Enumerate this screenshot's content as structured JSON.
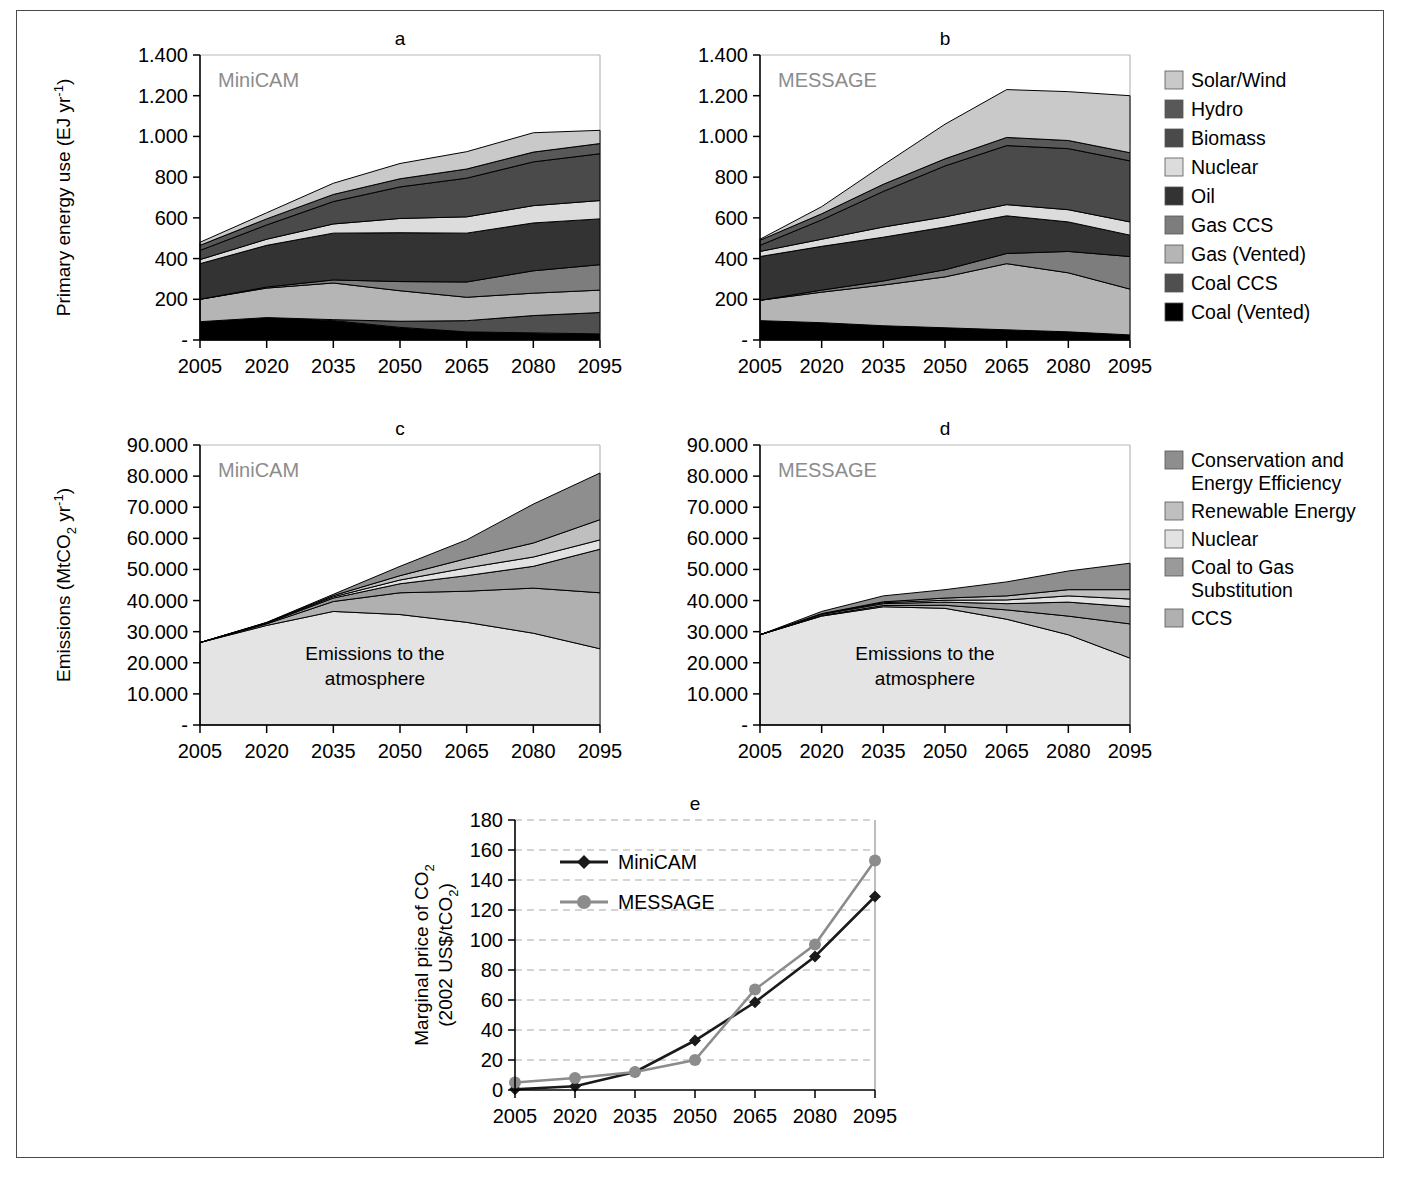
{
  "figure": {
    "panels": [
      "a",
      "b",
      "c",
      "d",
      "e"
    ],
    "model_minicam": "MiniCAM",
    "model_message": "MESSAGE",
    "atmosphere_label_line1": "Emissions to the",
    "atmosphere_label_line2": "atmosphere"
  },
  "energy_legend": {
    "items": [
      {
        "label": "Solar/Wind",
        "color": "#c9c9c9"
      },
      {
        "label": "Hydro",
        "color": "#585858"
      },
      {
        "label": "Biomass",
        "color": "#4a4a4a"
      },
      {
        "label": "Nuclear",
        "color": "#dcdcdc"
      },
      {
        "label": "Oil",
        "color": "#333333"
      },
      {
        "label": "Gas CCS",
        "color": "#7d7d7d"
      },
      {
        "label": "Gas (Vented)",
        "color": "#b5b5b5"
      },
      {
        "label": "Coal CCS",
        "color": "#4f4f4f"
      },
      {
        "label": "Coal (Vented)",
        "color": "#000000"
      }
    ]
  },
  "wedge_legend": {
    "items": [
      {
        "label": "Conservation and Energy Efficiency",
        "color": "#8e8e8e"
      },
      {
        "label": "Renewable Energy",
        "color": "#bfbfbf"
      },
      {
        "label": "Nuclear",
        "color": "#e2e2e2"
      },
      {
        "label": "Coal to Gas Substitution",
        "color": "#9a9a9a"
      },
      {
        "label": "CCS",
        "color": "#b0b0b0"
      }
    ]
  },
  "chart_data": [
    {
      "id": "a",
      "type": "area",
      "title": "a",
      "annotation": "MiniCAM",
      "xlabel": "",
      "ylabel": "Primary energy use (EJ yr-1)",
      "ylabel_display": "Primary energy use (EJ yr",
      "categories": [
        2005,
        2020,
        2035,
        2050,
        2065,
        2080,
        2095
      ],
      "xticklabels": [
        "2005",
        "2020",
        "2035",
        "2050",
        "2065",
        "2080",
        "2095"
      ],
      "yticklabels": [
        "-",
        "200",
        "400",
        "600",
        "800",
        "1.000",
        "1.200",
        "1.400"
      ],
      "ylim": [
        0,
        1400
      ],
      "ytickvalues": [
        0,
        200,
        400,
        600,
        800,
        1000,
        1200,
        1400
      ],
      "grid": false,
      "stack_order_bottom_to_top": [
        "Coal (Vented)",
        "Coal CCS",
        "Gas (Vented)",
        "Gas CCS",
        "Oil",
        "Nuclear",
        "Biomass",
        "Hydro",
        "Solar/Wind"
      ],
      "series": [
        {
          "name": "Coal (Vented)",
          "color": "#000000",
          "values": [
            90,
            110,
            95,
            62,
            40,
            35,
            30
          ]
        },
        {
          "name": "Coal CCS",
          "color": "#4f4f4f",
          "values": [
            0,
            0,
            5,
            30,
            55,
            85,
            105
          ]
        },
        {
          "name": "Gas (Vented)",
          "color": "#b5b5b5",
          "values": [
            110,
            145,
            180,
            150,
            115,
            110,
            110
          ]
        },
        {
          "name": "Gas CCS",
          "color": "#7d7d7d",
          "values": [
            0,
            5,
            15,
            45,
            75,
            110,
            125
          ]
        },
        {
          "name": "Oil",
          "color": "#333333",
          "values": [
            175,
            205,
            230,
            240,
            240,
            235,
            225
          ]
        },
        {
          "name": "Nuclear",
          "color": "#dcdcdc",
          "values": [
            20,
            30,
            45,
            70,
            80,
            85,
            90
          ]
        },
        {
          "name": "Biomass",
          "color": "#4a4a4a",
          "values": [
            45,
            70,
            110,
            155,
            190,
            215,
            230
          ]
        },
        {
          "name": "Hydro",
          "color": "#585858",
          "values": [
            25,
            30,
            35,
            40,
            45,
            48,
            50
          ]
        },
        {
          "name": "Solar/Wind",
          "color": "#c9c9c9",
          "values": [
            15,
            30,
            55,
            75,
            85,
            95,
            65
          ]
        }
      ],
      "totals": [
        480,
        625,
        770,
        867,
        925,
        1018,
        1030
      ]
    },
    {
      "id": "b",
      "type": "area",
      "title": "b",
      "annotation": "MESSAGE",
      "xlabel": "",
      "ylabel": "",
      "categories": [
        2005,
        2020,
        2035,
        2050,
        2065,
        2080,
        2095
      ],
      "xticklabels": [
        "2005",
        "2020",
        "2035",
        "2050",
        "2065",
        "2080",
        "2095"
      ],
      "yticklabels": [
        "-",
        "200",
        "400",
        "600",
        "800",
        "1.000",
        "1.200",
        "1.400"
      ],
      "ylim": [
        0,
        1400
      ],
      "ytickvalues": [
        0,
        200,
        400,
        600,
        800,
        1000,
        1200,
        1400
      ],
      "grid": false,
      "stack_order_bottom_to_top": [
        "Coal (Vented)",
        "Coal CCS",
        "Gas (Vented)",
        "Gas CCS",
        "Oil",
        "Nuclear",
        "Biomass",
        "Hydro",
        "Solar/Wind"
      ],
      "series": [
        {
          "name": "Coal (Vented)",
          "color": "#000000",
          "values": [
            95,
            85,
            70,
            60,
            50,
            40,
            25
          ]
        },
        {
          "name": "Coal CCS",
          "color": "#4f4f4f",
          "values": [
            0,
            0,
            0,
            0,
            0,
            0,
            0
          ]
        },
        {
          "name": "Gas (Vented)",
          "color": "#b5b5b5",
          "values": [
            100,
            150,
            200,
            250,
            325,
            290,
            225
          ]
        },
        {
          "name": "Gas CCS",
          "color": "#7d7d7d",
          "values": [
            0,
            10,
            20,
            35,
            50,
            105,
            160
          ]
        },
        {
          "name": "Oil",
          "color": "#333333",
          "values": [
            215,
            215,
            215,
            210,
            185,
            145,
            105
          ]
        },
        {
          "name": "Nuclear",
          "color": "#dcdcdc",
          "values": [
            25,
            35,
            50,
            50,
            55,
            60,
            65
          ]
        },
        {
          "name": "Biomass",
          "color": "#4a4a4a",
          "values": [
            30,
            95,
            175,
            250,
            290,
            300,
            300
          ]
        },
        {
          "name": "Hydro",
          "color": "#585858",
          "values": [
            25,
            30,
            35,
            35,
            40,
            40,
            40
          ]
        },
        {
          "name": "Solar/Wind",
          "color": "#c9c9c9",
          "values": [
            5,
            35,
            95,
            170,
            235,
            240,
            280
          ]
        }
      ],
      "totals": [
        495,
        655,
        860,
        1060,
        1230,
        1220,
        1200
      ]
    },
    {
      "id": "c",
      "type": "area",
      "title": "c",
      "annotation": "MiniCAM",
      "xlabel": "",
      "ylabel": "Emissions (MtCO2 yr-1)",
      "ylabel_display": "Emissions (MtCO",
      "categories": [
        2005,
        2020,
        2035,
        2050,
        2065,
        2080,
        2095
      ],
      "xticklabels": [
        "2005",
        "2020",
        "2035",
        "2050",
        "2065",
        "2080",
        "2095"
      ],
      "yticklabels": [
        "-",
        "10.000",
        "20.000",
        "30.000",
        "40.000",
        "50.000",
        "60.000",
        "70.000",
        "80.000",
        "90.000"
      ],
      "ylim": [
        0,
        90000
      ],
      "ytickvalues": [
        0,
        10000,
        20000,
        30000,
        40000,
        50000,
        60000,
        70000,
        80000,
        90000
      ],
      "grid": false,
      "baseline_total": [
        26500,
        33000,
        42000,
        51000,
        59500,
        71000,
        81000
      ],
      "series": [
        {
          "name": "Emissions to the atmosphere",
          "color": "#e4e4e4",
          "values": [
            26500,
            32000,
            36500,
            35500,
            33000,
            29500,
            24500
          ]
        },
        {
          "name": "CCS",
          "color": "#b0b0b0",
          "values": [
            0,
            500,
            3200,
            7000,
            10000,
            14500,
            18000
          ]
        },
        {
          "name": "Coal to Gas Substitution",
          "color": "#9a9a9a",
          "values": [
            0,
            200,
            1100,
            2900,
            5000,
            7000,
            14000
          ]
        },
        {
          "name": "Nuclear",
          "color": "#e2e2e2",
          "values": [
            0,
            100,
            400,
            1200,
            2500,
            3000,
            3000
          ]
        },
        {
          "name": "Renewable Energy",
          "color": "#bfbfbf",
          "values": [
            0,
            100,
            400,
            1400,
            3000,
            4500,
            6500
          ]
        },
        {
          "name": "Conservation and Energy Efficiency",
          "color": "#8e8e8e",
          "values": [
            0,
            100,
            400,
            3000,
            6000,
            12500,
            15000
          ]
        }
      ]
    },
    {
      "id": "d",
      "type": "area",
      "title": "d",
      "annotation": "MESSAGE",
      "xlabel": "",
      "ylabel": "",
      "categories": [
        2005,
        2020,
        2035,
        2050,
        2065,
        2080,
        2095
      ],
      "xticklabels": [
        "2005",
        "2020",
        "2035",
        "2050",
        "2065",
        "2080",
        "2095"
      ],
      "yticklabels": [
        "-",
        "10.000",
        "20.000",
        "30.000",
        "40.000",
        "50.000",
        "60.000",
        "70.000",
        "80.000",
        "90.000"
      ],
      "ylim": [
        0,
        90000
      ],
      "ytickvalues": [
        0,
        10000,
        20000,
        30000,
        40000,
        50000,
        60000,
        70000,
        80000,
        90000
      ],
      "grid": false,
      "baseline_total": [
        29000,
        36500,
        41500,
        43500,
        46000,
        49500,
        52000
      ],
      "series": [
        {
          "name": "Emissions to the atmosphere",
          "color": "#e4e4e4",
          "values": [
            29000,
            35000,
            38000,
            37500,
            34000,
            29000,
            21500
          ]
        },
        {
          "name": "CCS",
          "color": "#b0b0b0",
          "values": [
            0,
            200,
            400,
            1000,
            3000,
            6000,
            11000
          ]
        },
        {
          "name": "Coal to Gas Substitution",
          "color": "#9a9a9a",
          "values": [
            0,
            400,
            600,
            1000,
            2000,
            4500,
            5500
          ]
        },
        {
          "name": "Nuclear",
          "color": "#e2e2e2",
          "values": [
            0,
            100,
            300,
            600,
            1200,
            2000,
            2500
          ]
        },
        {
          "name": "Renewable Energy",
          "color": "#bfbfbf",
          "values": [
            0,
            100,
            300,
            700,
            1300,
            2000,
            3000
          ]
        },
        {
          "name": "Conservation and Energy Efficiency",
          "color": "#8e8e8e",
          "values": [
            0,
            700,
            1900,
            2700,
            4500,
            6000,
            8500
          ]
        }
      ]
    },
    {
      "id": "e",
      "type": "line",
      "title": "e",
      "xlabel": "",
      "ylabel": "Marginal price of CO2 (2002 US$/tCO2)",
      "ylabel_line1": "Marginal price of CO",
      "ylabel_line2": "(2002 US$/tCO",
      "categories": [
        2005,
        2020,
        2035,
        2050,
        2065,
        2080,
        2095
      ],
      "xticklabels": [
        "2005",
        "2020",
        "2035",
        "2050",
        "2065",
        "2080",
        "2095"
      ],
      "yticklabels": [
        "0",
        "20",
        "40",
        "60",
        "80",
        "100",
        "120",
        "140",
        "160",
        "180"
      ],
      "ylim": [
        0,
        180
      ],
      "ytickvalues": [
        0,
        20,
        40,
        60,
        80,
        100,
        120,
        140,
        160,
        180
      ],
      "grid": true,
      "legend_position": "upper-left-inside",
      "series": [
        {
          "name": "MiniCAM",
          "color": "#1a1a1a",
          "marker": "diamond",
          "values": [
            0.5,
            2.5,
            12,
            33,
            58.5,
            89,
            129
          ]
        },
        {
          "name": "MESSAGE",
          "color": "#8c8c8c",
          "marker": "circle",
          "values": [
            5,
            8,
            12,
            20,
            67,
            97,
            153
          ]
        }
      ]
    }
  ]
}
